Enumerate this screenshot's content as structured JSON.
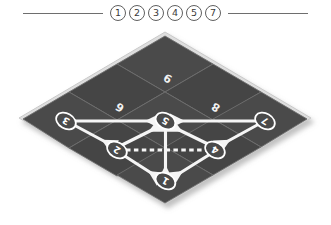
{
  "legend": {
    "chips": [
      "1",
      "2",
      "3",
      "4",
      "5",
      "7"
    ],
    "rule_left": "",
    "rule_right": ""
  },
  "board": {
    "tiles": [
      {
        "id": "tile-6",
        "label": "6"
      },
      {
        "id": "tile-9",
        "label": "9"
      },
      {
        "id": "tile-8",
        "label": "8"
      }
    ],
    "nodes": [
      {
        "id": "node-3",
        "label": "3"
      },
      {
        "id": "node-5",
        "label": "5"
      },
      {
        "id": "node-7",
        "label": "7"
      },
      {
        "id": "node-2",
        "label": "2"
      },
      {
        "id": "node-4",
        "label": "4"
      },
      {
        "id": "node-1",
        "label": "1"
      }
    ],
    "edges": [
      {
        "id": "edge-3-5",
        "from": "3",
        "to": "5",
        "style": "solid"
      },
      {
        "id": "edge-7-5",
        "from": "7",
        "to": "5",
        "style": "solid"
      },
      {
        "id": "edge-3-2",
        "from": "3",
        "to": "2",
        "style": "solid"
      },
      {
        "id": "edge-7-4",
        "from": "7",
        "to": "4",
        "style": "solid"
      },
      {
        "id": "edge-2-5",
        "from": "2",
        "to": "5",
        "style": "solid"
      },
      {
        "id": "edge-4-5",
        "from": "4",
        "to": "5",
        "style": "solid"
      },
      {
        "id": "edge-5-1",
        "from": "5",
        "to": "1",
        "style": "solid"
      },
      {
        "id": "edge-2-1",
        "from": "2",
        "to": "1",
        "style": "solid"
      },
      {
        "id": "edge-4-1",
        "from": "4",
        "to": "1",
        "style": "solid"
      },
      {
        "id": "edge-2-4",
        "from": "2",
        "to": "4",
        "style": "dashed"
      }
    ]
  },
  "colors": {
    "background": "#ffffff",
    "tile_fill": "#4a4a4a",
    "tile_fill_alt": "#454545",
    "tile_edge": "#6d6d6d",
    "board_rim": "#d9d9d9",
    "edge_line": "#f5f5f5",
    "node_stroke": "#ffffff",
    "legend_rule": "#6e6e6e",
    "chip_text": "#3a3a3a"
  }
}
